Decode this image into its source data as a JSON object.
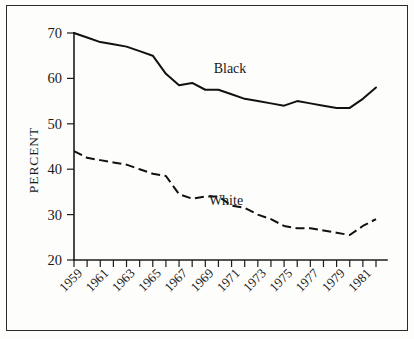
{
  "chart_data": {
    "type": "line",
    "title": "",
    "subtitle": "",
    "xlabel": "",
    "ylabel": "PERCENT",
    "xlim": [
      1959,
      1982
    ],
    "ylim": [
      20,
      70
    ],
    "grid": false,
    "legend_position": "inline-annotations",
    "y_ticks": [
      20,
      30,
      40,
      50,
      60,
      70
    ],
    "y_tick_labels": [
      "20",
      "30",
      "40",
      "50",
      "60",
      "70"
    ],
    "x_ticks": [
      1959,
      1960,
      1961,
      1962,
      1963,
      1964,
      1965,
      1966,
      1967,
      1968,
      1969,
      1970,
      1971,
      1972,
      1973,
      1974,
      1975,
      1976,
      1977,
      1978,
      1979,
      1980,
      1981,
      1982
    ],
    "x_tick_labels": [
      "1959",
      "1961",
      "1963",
      "1965",
      "1967",
      "1969",
      "1971",
      "1973",
      "1975",
      "1977",
      "1979",
      "1981"
    ],
    "x_labelled_ticks": [
      1959,
      1961,
      1963,
      1965,
      1967,
      1969,
      1971,
      1973,
      1975,
      1977,
      1979,
      1981
    ],
    "x": [
      1959,
      1960,
      1961,
      1962,
      1963,
      1964,
      1965,
      1966,
      1967,
      1968,
      1969,
      1970,
      1971,
      1972,
      1973,
      1974,
      1975,
      1976,
      1977,
      1978,
      1979,
      1980,
      1981,
      1982
    ],
    "series": [
      {
        "name": "Black",
        "style": "solid",
        "color": "#111111",
        "annotation": "Black",
        "values": [
          70.0,
          69.0,
          68.0,
          67.5,
          67.0,
          66.0,
          65.0,
          61.0,
          58.5,
          59.0,
          57.5,
          57.5,
          56.5,
          55.5,
          55.0,
          54.5,
          54.0,
          55.0,
          54.5,
          54.0,
          53.5,
          53.5,
          55.5,
          58.0
        ]
      },
      {
        "name": "White",
        "style": "dashed",
        "color": "#111111",
        "annotation": "White",
        "values": [
          44.0,
          42.5,
          42.0,
          41.5,
          41.0,
          40.0,
          39.0,
          38.5,
          34.5,
          33.5,
          34.0,
          34.0,
          32.0,
          31.5,
          30.0,
          29.0,
          27.5,
          27.0,
          27.0,
          26.5,
          26.0,
          25.5,
          27.5,
          29.0
        ]
      }
    ]
  },
  "annotations": {
    "black_label": "Black",
    "white_label": "White",
    "y_axis_title": "PERCENT"
  }
}
